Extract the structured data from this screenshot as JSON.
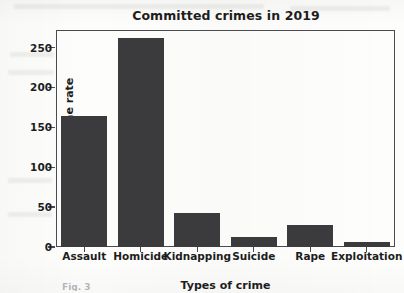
{
  "figure": {
    "background_color": "#fdfdfc",
    "axis_color": "#4a4a50",
    "text_color": "#1d1d1d"
  },
  "caption_fragment": "Fig. 3",
  "chart_data": {
    "type": "bar",
    "title": "Committed crimes in 2019",
    "xlabel": "Types of crime",
    "ylabel": "Crime rate",
    "categories": [
      "Assault",
      "Homicide",
      "Kidnapping",
      "Suicide",
      "Rape",
      "Exploitation"
    ],
    "values": [
      164,
      262,
      43,
      13,
      28,
      6
    ],
    "ylim": [
      0,
      272
    ],
    "yticks": [
      0,
      50,
      100,
      150,
      200,
      250
    ],
    "ytick_labels": [
      "0",
      "50",
      "100",
      "150",
      "200",
      "250"
    ],
    "grid": false,
    "legend": null,
    "bar_color": "#3b3b3d",
    "bar_width_ratio": 0.82
  }
}
